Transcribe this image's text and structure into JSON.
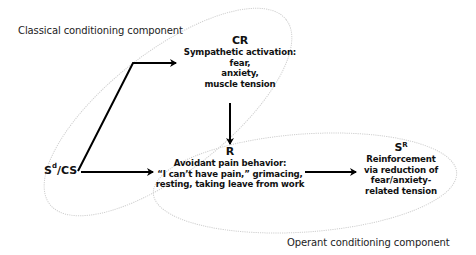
{
  "diagram": {
    "type": "flow",
    "components": {
      "classical": {
        "label": "Classical conditioning component"
      },
      "operant": {
        "label": "Operant conditioning component"
      }
    },
    "nodes": {
      "sd_cs": {
        "base": "S",
        "sup": "d",
        "rest": "/CS"
      },
      "cr": {
        "title": "CR",
        "lines": [
          "Sympathetic activation:",
          "fear,",
          "anxiety,",
          "muscle tension"
        ]
      },
      "r": {
        "title": "R",
        "lines": [
          "Avoidant pain behavior:",
          "“I can’t have pain,” grimacing,",
          "resting, taking leave from work"
        ]
      },
      "sr": {
        "title_base": "S",
        "title_sup": "R",
        "lines": [
          "Reinforcement",
          "via reduction of",
          "fear/anxiety-",
          "related tension"
        ]
      }
    },
    "edges": [
      {
        "from": "Sd/CS",
        "to": "CR"
      },
      {
        "from": "Sd/CS",
        "to": "R"
      },
      {
        "from": "CR",
        "to": "R"
      },
      {
        "from": "R",
        "to": "SR"
      }
    ],
    "colors": {
      "arrow": "#000000",
      "ellipse": "#c8c8c8",
      "text": "#111111"
    }
  }
}
